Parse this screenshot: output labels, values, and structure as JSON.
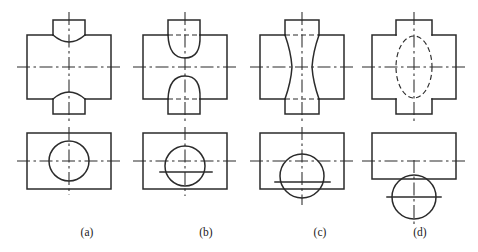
{
  "figure": {
    "canvas": {
      "width": 478,
      "height": 252,
      "background": "#ffffff"
    },
    "line_colors": {
      "object_line": "#2b2b2b",
      "hidden_line": "#2b2b2b",
      "center_line": "#2b2b2b",
      "text": "#1a1a1a"
    },
    "rows": [
      {
        "name": "front-view-row",
        "label": "front views (top row)"
      },
      {
        "name": "top-view-row",
        "label": "top views (bottom row)"
      }
    ],
    "captions": [
      {
        "key": "a",
        "text": "(a)",
        "x": 87,
        "y": 236
      },
      {
        "key": "b",
        "text": "(b)",
        "x": 206,
        "y": 236
      },
      {
        "key": "c",
        "text": "(c)",
        "x": 320,
        "y": 236
      },
      {
        "key": "d",
        "text": "(d)",
        "x": 420,
        "y": 236
      }
    ],
    "cases": [
      {
        "key": "a",
        "caption": "(a)",
        "description": "small vertical cylinder through large horizontal cylinder; intersection curves bow toward the small cylinder axis",
        "front_view": {
          "body_rect": {
            "x": 27,
            "y": 35,
            "width": 84,
            "height": 64
          },
          "stub_rect": {
            "x": 53,
            "y": 20,
            "width": 32,
            "height": 94
          },
          "curve_type": "shallow-arc",
          "arc_bulge": 7,
          "hidden_lines": false
        },
        "top_view": {
          "body_rect": {
            "x": 27,
            "y": 133,
            "width": 84,
            "height": 56
          },
          "circle": {
            "cx": 69,
            "cy": 161,
            "r": 20
          },
          "circle_style": "solid",
          "h_center_y": 161
        },
        "center_lines": {
          "vertical_x": 69,
          "front_h_y": 67,
          "top_h_y": 161
        }
      },
      {
        "key": "b",
        "caption": "(b)",
        "description": "medium vertical cylinder; intersection curves bow away, hidden chord shown dashed",
        "front_view": {
          "body_rect": {
            "x": 143,
            "y": 35,
            "width": 84,
            "height": 64
          },
          "stub_rect": {
            "x": 168,
            "y": 20,
            "width": 32,
            "height": 94
          },
          "curve_type": "deep-arc",
          "arc_bulge": 18,
          "hidden_lines": true
        },
        "top_view": {
          "body_rect": {
            "x": 143,
            "y": 133,
            "width": 84,
            "height": 56
          },
          "circle": {
            "cx": 185,
            "cy": 166,
            "r": 20
          },
          "circle_style": "solid",
          "h_center_y": 161,
          "extra_h_line_y": 172
        },
        "center_lines": {
          "vertical_x": 185,
          "front_h_y": 67,
          "top_h_y": 161
        }
      },
      {
        "key": "c",
        "caption": "(c)",
        "description": "equal diameters; intersection becomes straight waisted (hourglass) lines",
        "front_view": {
          "body_rect": {
            "x": 260,
            "y": 35,
            "width": 84,
            "height": 64
          },
          "stub_rect": {
            "x": 285,
            "y": 20,
            "width": 34,
            "height": 94
          },
          "curve_type": "hourglass",
          "waist_inset": 7,
          "hidden_lines": true
        },
        "top_view": {
          "body_rect": {
            "x": 260,
            "y": 133,
            "width": 84,
            "height": 56
          },
          "circle": {
            "cx": 302,
            "cy": 176,
            "r": 22
          },
          "circle_style": "solid",
          "h_center_y": 161,
          "extra_h_line_y": 182
        },
        "center_lines": {
          "vertical_x": 302,
          "front_h_y": 67,
          "top_h_y": 161
        }
      },
      {
        "key": "d",
        "caption": "(d)",
        "description": "large vertical cylinder; intersection appears as hidden ellipse bowing toward the horizontal axis",
        "front_view": {
          "body_rect": {
            "x": 372,
            "y": 35,
            "width": 84,
            "height": 64
          },
          "stub_rect": {
            "x": 396,
            "y": 20,
            "width": 36,
            "height": 94
          },
          "curve_type": "ellipse",
          "ellipse": {
            "cx": 414,
            "cy": 67,
            "rx": 18,
            "ry": 31
          },
          "hidden_lines": true
        },
        "top_view": {
          "body_rect": {
            "x": 372,
            "y": 133,
            "width": 84,
            "height": 46
          },
          "circle": {
            "cx": 414,
            "cy": 197,
            "r": 22
          },
          "circle_style": "solid",
          "h_center_y": 161
        },
        "center_lines": {
          "vertical_x": 414,
          "front_h_y": 67,
          "top_h_y": 161
        }
      }
    ]
  }
}
